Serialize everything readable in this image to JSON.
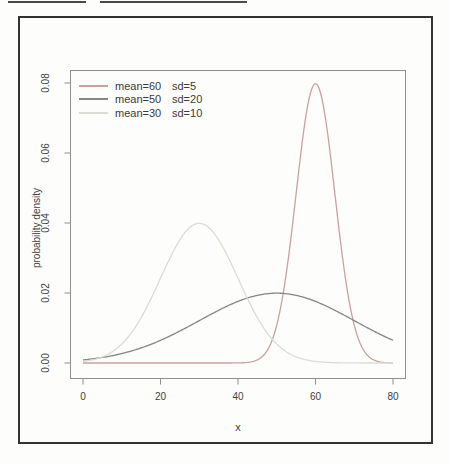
{
  "figure": {
    "background": "#fdfdfb",
    "border_color": "#333333",
    "artifact_line_color": "#4a4a4a"
  },
  "chart_data": {
    "type": "line",
    "title": "",
    "xlabel": "x",
    "ylabel": "probability density",
    "xlim": [
      0,
      80
    ],
    "ylim": [
      0,
      0.08
    ],
    "x_ticks": [
      0,
      20,
      40,
      60,
      80
    ],
    "y_ticks": [
      0,
      0.02,
      0.04,
      0.06,
      0.08
    ],
    "y_tick_labels": [
      "0.00",
      "0.02",
      "0.04",
      "0.06",
      "0.08"
    ],
    "grid": false,
    "legend_position": "top-left",
    "axis_color": "#8f8f8f",
    "text_color": "#3f3f3f",
    "series": [
      {
        "name": "mean=60  sd=5",
        "distribution": "normal",
        "mean": 60,
        "sd": 5,
        "color": "#c9a29d",
        "legend_mean_label": "mean=60",
        "legend_sd_label": "sd=5",
        "peak_x": 60,
        "peak_y": 0.0798
      },
      {
        "name": "mean=50  sd=20",
        "distribution": "normal",
        "mean": 50,
        "sd": 20,
        "color": "#85858a",
        "legend_mean_label": "mean=50",
        "legend_sd_label": "sd=20",
        "peak_x": 50,
        "peak_y": 0.0199
      },
      {
        "name": "mean=30  sd=10",
        "distribution": "normal",
        "mean": 30,
        "sd": 10,
        "color": "#d9ded3",
        "legend_mean_label": "mean=30",
        "legend_sd_label": "sd=10",
        "peak_x": 30,
        "peak_y": 0.0399
      }
    ]
  }
}
